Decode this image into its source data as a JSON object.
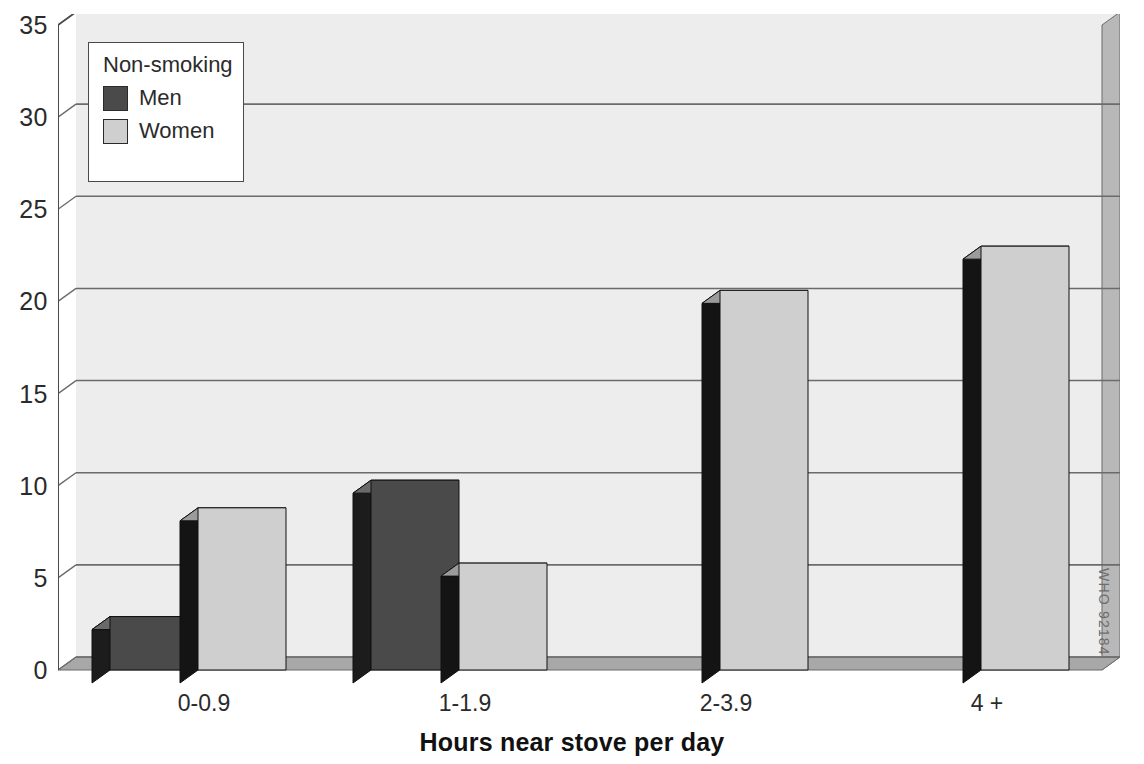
{
  "chart_data": {
    "type": "bar",
    "title": "",
    "subtitle": "",
    "xlabel": "Hours near stove per day",
    "ylabel": "",
    "categories": [
      "0-0.9",
      "1-1.9",
      "2-3.9",
      "4 +"
    ],
    "series": [
      {
        "name": "Men",
        "values": [
          2.9,
          10.3,
          0,
          0
        ],
        "color": "#4a4a4a"
      },
      {
        "name": "Women",
        "values": [
          8.8,
          5.8,
          20.6,
          23.0
        ],
        "color": "#cfcfcf"
      }
    ],
    "ylim": [
      0,
      35
    ],
    "yticks": [
      0,
      5,
      10,
      15,
      20,
      25,
      30,
      35
    ],
    "ytick_labels": [
      "0",
      "5",
      "10",
      "15",
      "20",
      "25",
      "30",
      "35"
    ],
    "grid": true,
    "grid_axis": "y",
    "legend": {
      "title": "Non-smoking",
      "position": "upper-left",
      "entries": [
        "Men",
        "Women"
      ]
    },
    "style": {
      "three_d": true,
      "plot_background": "#ededed",
      "gridline_color": "#6b6b6b",
      "axis_color": "#4a4a4a",
      "wall_color": "#b8b8b8",
      "floor_color": "#a8a8a8",
      "men_top_color": "#6a6a6a",
      "men_side_color": "#1c1c1c",
      "women_top_color": "#9b9b9b",
      "women_side_color": "#141414"
    }
  },
  "watermark": {
    "text": "WHO 92184"
  }
}
